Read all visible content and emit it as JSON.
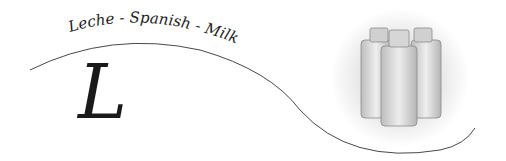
{
  "logo": {
    "tagline": "Leche - Spanish - Milk",
    "monogram": "L",
    "illustration": "milk-bottles",
    "colors": {
      "ink": "#1a1a1a",
      "curve": "#333333",
      "halo": "#d8d8d8",
      "background": "#ffffff"
    }
  }
}
